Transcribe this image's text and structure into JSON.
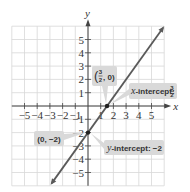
{
  "chart_data": {
    "type": "line",
    "title": "",
    "xlabel": "x",
    "ylabel": "y",
    "xlim": [
      -6,
      6
    ],
    "ylim": [
      -6,
      6
    ],
    "grid": true,
    "x_ticks": [
      -5,
      -4,
      -3,
      -2,
      -1,
      1,
      2,
      3,
      4,
      5
    ],
    "x_tick_labels": [
      "−5",
      "−4",
      "−3",
      "−2",
      "−1",
      "1",
      "2",
      "3",
      "4",
      "5"
    ],
    "y_ticks": [
      5,
      4,
      3,
      2,
      1,
      -1,
      -2,
      -3,
      -4,
      -5
    ],
    "y_tick_labels": [
      "5",
      "4",
      "3",
      "2",
      "1",
      "−1",
      "−2",
      "−3",
      "−4",
      "−5"
    ],
    "series": [
      {
        "name": "line",
        "equation": "y = (4/3)x - 2",
        "slope": 1.3333,
        "intercept": -2,
        "x": [
          -2.85,
          5.9
        ],
        "y": [
          -5.8,
          5.87
        ],
        "arrows": "both",
        "color": "#5a5a5a"
      }
    ],
    "points": [
      {
        "name": "x-intercept-point",
        "x": 1.5,
        "y": 0
      },
      {
        "name": "y-intercept-point",
        "x": 0,
        "y": -2
      }
    ],
    "annotations": [
      {
        "name": "x-intercept-coord",
        "text_open": "(",
        "frac_num": "3",
        "frac_den": "2",
        "text_rest": ", 0)",
        "target": [
          1.5,
          0
        ]
      },
      {
        "name": "x-intercept-label",
        "italic": "x",
        "text": "-intercept: ",
        "frac_num": "3",
        "frac_den": "2",
        "target": [
          1.5,
          0
        ]
      },
      {
        "name": "y-intercept-coord",
        "text": "(0, −2)",
        "target": [
          0,
          -2
        ]
      },
      {
        "name": "y-intercept-label",
        "italic": "y",
        "text": "-intercept: −2",
        "target": [
          0,
          -2
        ]
      }
    ],
    "colors": {
      "grid": "#d8d8d8",
      "axis": "#444444",
      "line": "#5a5a5a",
      "callout_bg": "#d9d9d9"
    }
  }
}
